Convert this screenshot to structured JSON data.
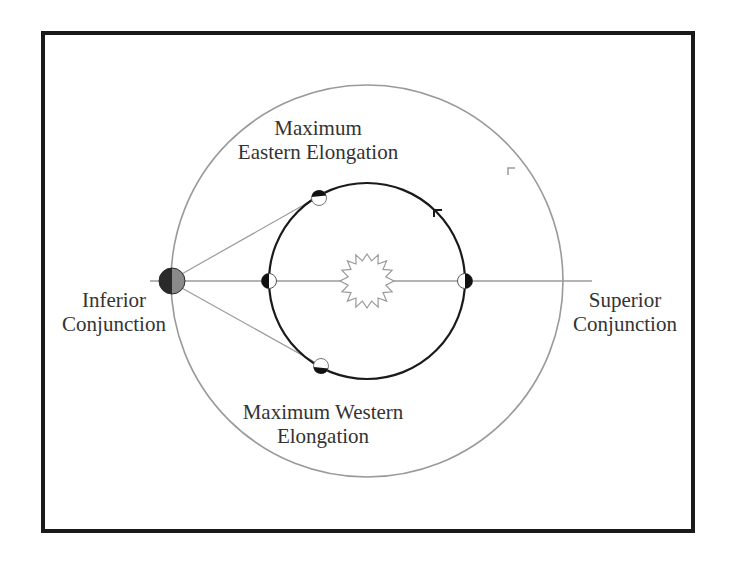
{
  "diagram": {
    "colors": {
      "frame": "#1a1a1a",
      "outer_orbit": "#9a9a9a",
      "inner_orbit": "#1a1a1a",
      "sight_line": "#9a9a9a",
      "earth_dark": "#2a2a2a",
      "earth_light": "#8a8a8a",
      "planet_dark": "#111111",
      "planet_light": "#ffffff",
      "sun_outline": "#9a9a9a",
      "text": "#333333"
    },
    "labels": {
      "max_eastern": {
        "line1": "Maximum",
        "line2": "Eastern Elongation"
      },
      "max_western": {
        "line1": "Maximum Western",
        "line2": "Elongation"
      },
      "inferior": {
        "line1": "Inferior",
        "line2": "Conjunction"
      },
      "superior": {
        "line1": "Superior",
        "line2": "Conjunction"
      }
    },
    "elements": {
      "sun": "sun-icon (zigzag star)",
      "earth": "earth (half-shaded disc)",
      "planet_positions": [
        "inferior-conjunction",
        "superior-conjunction",
        "max-eastern-elongation",
        "max-western-elongation"
      ],
      "orbit_direction_markers": [
        "outer-orbit-arrow",
        "inner-orbit-arrow"
      ]
    }
  }
}
